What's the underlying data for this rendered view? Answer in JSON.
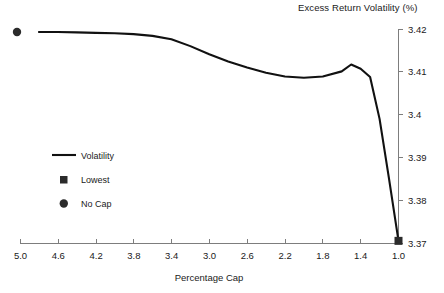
{
  "chart_data": {
    "type": "line",
    "title": "Excess Return Volatility (%)",
    "xlabel": "Percentage Cap",
    "ylabel": "",
    "grid": false,
    "legend_position": "middle-left",
    "xlim": [
      5.0,
      1.0
    ],
    "ylim": [
      3.37,
      3.42
    ],
    "x_ticks": [
      "5.0",
      "4.6",
      "4.2",
      "3.8",
      "3.4",
      "3.0",
      "2.6",
      "2.2",
      "1.8",
      "1.4",
      "1.0"
    ],
    "y_ticks": [
      "3.37",
      "3.38",
      "3.39",
      "3.4",
      "3.41",
      "3.42"
    ],
    "x": [
      4.8,
      4.6,
      4.4,
      4.2,
      4.0,
      3.8,
      3.6,
      3.4,
      3.2,
      3.0,
      2.8,
      2.6,
      2.4,
      2.2,
      2.0,
      1.8,
      1.6,
      1.5,
      1.4,
      1.3,
      1.2,
      1.1,
      1.0
    ],
    "series": [
      {
        "name": "Volatility",
        "values": [
          3.4193,
          3.4193,
          3.4192,
          3.4191,
          3.419,
          3.4188,
          3.4184,
          3.4176,
          3.416,
          3.4141,
          3.4124,
          3.411,
          3.4098,
          3.4089,
          3.4086,
          3.4089,
          3.4101,
          3.4117,
          3.4107,
          3.4088,
          3.399,
          3.385,
          3.3705
        ]
      }
    ],
    "points": [
      {
        "name": "No Cap",
        "marker": "circle",
        "value": 3.4193,
        "position": "outside-left"
      },
      {
        "name": "Lowest",
        "marker": "square",
        "x": 1.0,
        "value": 3.3705
      }
    ],
    "legend": [
      {
        "label": "Volatility",
        "marker": "line"
      },
      {
        "label": "Lowest",
        "marker": "square"
      },
      {
        "label": "No Cap",
        "marker": "circle"
      }
    ],
    "colors": {
      "line": "#111111",
      "marker": "#2b2b2b",
      "axis": "#7d7d7d",
      "text": "#1a1a1a",
      "background": "#ffffff"
    }
  }
}
